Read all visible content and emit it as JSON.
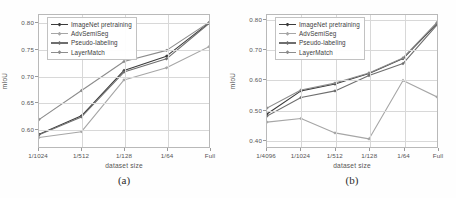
{
  "figure": {
    "panels": [
      {
        "caption": "(a)",
        "xlabel": "dataset size",
        "ylabel": "mIoU",
        "xticks": [
          "1/1024",
          "1/512",
          "1/128",
          "1/64",
          "Full"
        ],
        "yticks": [
          "0.60",
          "0.65",
          "0.70",
          "0.75",
          "0.80"
        ]
      },
      {
        "caption": "(b)",
        "xlabel": "dataset size",
        "ylabel": "mIoU",
        "xticks": [
          "1/4096",
          "1/1024",
          "1/512",
          "1/128",
          "1/64",
          "Full"
        ],
        "yticks": [
          "0.40",
          "0.50",
          "0.60",
          "0.70",
          "0.80"
        ]
      }
    ],
    "legend": [
      {
        "label": "ImageNet pretraining",
        "color": "#3b3b3b"
      },
      {
        "label": "AdvSemiSeg",
        "color": "#a6a6a6"
      },
      {
        "label": "Pseudo-labeling",
        "color": "#6e6e6e"
      },
      {
        "label": "LayerMatch",
        "color": "#8c8c8c"
      }
    ]
  },
  "chart_data": [
    {
      "type": "line",
      "title": "(a)",
      "xlabel": "dataset size",
      "ylabel": "mIoU",
      "categories": [
        "1/1024",
        "1/512",
        "1/128",
        "1/64",
        "Full"
      ],
      "ylim": [
        0.565,
        0.815
      ],
      "yticks": [
        0.6,
        0.65,
        0.7,
        0.75,
        0.8
      ],
      "grid": true,
      "legend_position": "upper-left",
      "series": [
        {
          "name": "ImageNet pretraining",
          "color": "#3b3b3b",
          "values": [
            0.589,
            0.624,
            0.71,
            0.737,
            0.8
          ]
        },
        {
          "name": "AdvSemiSeg",
          "color": "#a6a6a6",
          "values": [
            0.583,
            0.594,
            0.692,
            0.715,
            0.755
          ]
        },
        {
          "name": "Pseudo-labeling",
          "color": "#6e6e6e",
          "values": [
            0.588,
            0.622,
            0.707,
            0.732,
            0.799
          ]
        },
        {
          "name": "LayerMatch",
          "color": "#8c8c8c",
          "values": [
            0.617,
            0.672,
            0.727,
            0.748,
            0.801
          ]
        }
      ]
    },
    {
      "type": "line",
      "title": "(b)",
      "xlabel": "dataset size",
      "ylabel": "mIoU",
      "categories": [
        "1/4096",
        "1/1024",
        "1/512",
        "1/128",
        "1/64",
        "Full"
      ],
      "ylim": [
        0.375,
        0.815
      ],
      "yticks": [
        0.4,
        0.5,
        0.6,
        0.7,
        0.8
      ],
      "grid": true,
      "legend_position": "upper-left",
      "series": [
        {
          "name": "ImageNet pretraining",
          "color": "#3b3b3b",
          "values": [
            0.485,
            0.562,
            0.585,
            0.62,
            0.67,
            0.787
          ]
        },
        {
          "name": "AdvSemiSeg",
          "color": "#a6a6a6",
          "values": [
            0.458,
            0.47,
            0.422,
            0.402,
            0.597,
            0.542
          ]
        },
        {
          "name": "Pseudo-labeling",
          "color": "#6e6e6e",
          "values": [
            0.478,
            0.54,
            0.562,
            0.613,
            0.653,
            0.782
          ]
        },
        {
          "name": "LayerMatch",
          "color": "#8c8c8c",
          "values": [
            0.505,
            0.565,
            0.588,
            0.622,
            0.672,
            0.79
          ]
        }
      ]
    }
  ]
}
